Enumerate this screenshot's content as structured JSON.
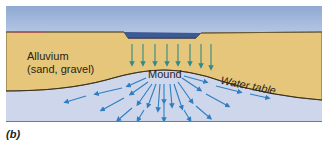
{
  "figure": {
    "panel_label": "(b)",
    "labels": {
      "alluvium_line1": "Alluvium",
      "alluvium_line2": "(sand, gravel)",
      "mound": "Mound",
      "water_table": "Water table"
    },
    "layers": [
      {
        "name": "sky",
        "color": "#a9bfdf"
      },
      {
        "name": "alluvium",
        "color": "#e6c67a"
      },
      {
        "name": "surface-water",
        "color": "#3d5a96"
      },
      {
        "name": "saturated-zone",
        "color": "#cdd6ea"
      }
    ],
    "arrow_colors": {
      "infiltration": "#2f8a8a",
      "groundwater_flow": "#2f7fc0"
    },
    "infiltration_arrow_count": 8,
    "flow_arrow_count": 22
  }
}
